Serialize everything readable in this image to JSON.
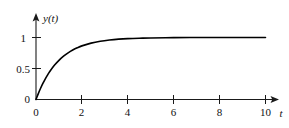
{
  "chart_data": {
    "type": "line",
    "title": "",
    "subtitle": "",
    "xlabel": "t",
    "ylabel": "y(t)",
    "xlim": [
      0,
      10.6
    ],
    "ylim": [
      0,
      1.12
    ],
    "grid": false,
    "legend": null,
    "x_ticks": [
      0,
      2,
      4,
      6,
      8,
      10
    ],
    "x_tick_labels": [
      "0",
      "2",
      "4",
      "6",
      "8",
      "10"
    ],
    "y_ticks": [
      0,
      0.5,
      1
    ],
    "y_tick_labels": [
      "0",
      "0.5",
      "1"
    ],
    "series": [
      {
        "name": "y(t)",
        "color": "#000000",
        "x": [
          0,
          0.1,
          0.2,
          0.3,
          0.4,
          0.5,
          0.6,
          0.8,
          1.0,
          1.2,
          1.4,
          1.6,
          1.8,
          2.0,
          2.4,
          2.8,
          3.2,
          3.6,
          4.0,
          4.5,
          5.0,
          6.0,
          7.0,
          8.0,
          9.0,
          10.0
        ],
        "y": [
          0,
          0.095,
          0.181,
          0.259,
          0.33,
          0.393,
          0.451,
          0.551,
          0.632,
          0.699,
          0.753,
          0.798,
          0.835,
          0.865,
          0.909,
          0.939,
          0.959,
          0.973,
          0.982,
          0.989,
          0.993,
          0.998,
          0.999,
          1.0,
          1.0,
          1.0
        ]
      }
    ],
    "annotations": []
  },
  "axis_labels": {
    "y_axis_title": "y(t)",
    "x_axis_title": "t",
    "y_tick_1": "1",
    "y_tick_half": "0.5",
    "y_tick_zero": "0",
    "x_tick_0": "0",
    "x_tick_2": "2",
    "x_tick_4": "4",
    "x_tick_6": "6",
    "x_tick_8": "8",
    "x_tick_10": "10"
  },
  "colors": {
    "curve": "#000000",
    "axis": "#1a1a1a",
    "text": "#111111",
    "background": "#ffffff"
  }
}
